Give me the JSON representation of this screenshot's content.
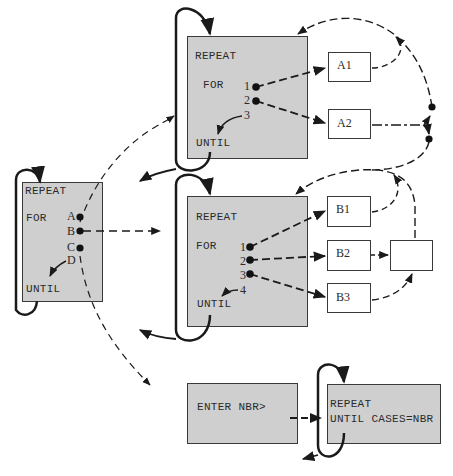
{
  "diagram": {
    "left_block": {
      "repeat": "REPEAT",
      "for": "FOR",
      "until": "UNTIL",
      "cases": [
        "A",
        "B",
        "C",
        "D"
      ]
    },
    "block_a": {
      "repeat": "REPEAT",
      "for": "FOR",
      "until": "UNTIL",
      "cases": [
        "1",
        "2",
        "3"
      ],
      "targets": [
        "A1",
        "A2"
      ]
    },
    "block_b": {
      "repeat": "REPEAT",
      "for": "FOR",
      "until": "UNTIL",
      "cases": [
        "1",
        "2",
        "3",
        "4"
      ],
      "targets": [
        "B1",
        "B2",
        "B3"
      ],
      "extra_box": ""
    },
    "bottom": {
      "prompt": "ENTER NBR>",
      "repeat": "REPEAT",
      "until": "UNTIL CASES=NBR"
    },
    "colors": {
      "box_fill": "#cfcfcf",
      "line": "#1a1a1a"
    }
  }
}
